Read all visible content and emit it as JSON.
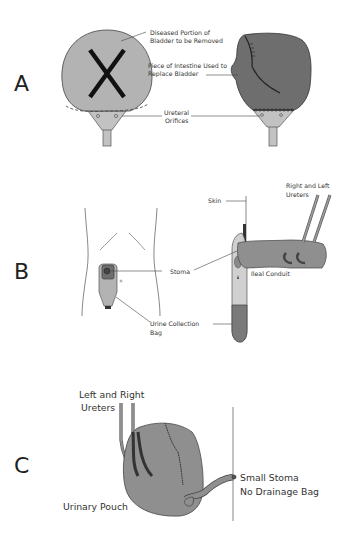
{
  "figure": {
    "panels": [
      {
        "id": "A",
        "letter": "A",
        "labels": {
          "diseased_line1": "Diseased Portion of",
          "diseased_line2": "Bladder to be Removed",
          "intestine_line1": "Piece of Intestine Used to",
          "intestine_line2": "Replace Bladder",
          "orifices_line1": "Ureteral",
          "orifices_line2": "Orifices"
        }
      },
      {
        "id": "B",
        "letter": "B",
        "labels": {
          "skin": "Skin",
          "ureters_line1": "Right and Left",
          "ureters_line2": "Ureters",
          "stoma": "Stoma",
          "ileal_conduit": "Ileal Conduit",
          "bag_line1": "Urine Collection",
          "bag_line2": "Bag"
        }
      },
      {
        "id": "C",
        "letter": "C",
        "labels": {
          "ureters_line1": "Left and Right",
          "ureters_line2": "Ureters",
          "small_stoma_line1": "Small Stoma",
          "small_stoma_line2": "No Drainage Bag",
          "pouch": "Urinary Pouch"
        }
      }
    ],
    "colors": {
      "bladder_light": "#b3b3b3",
      "bladder_dark": "#6e6e6e",
      "neck": "#c8c8c8",
      "tube": "#8f8f8f",
      "ureter_dark": "#3a3a3a",
      "bag_bottom": "#7a7a7a",
      "line": "#444444"
    }
  }
}
